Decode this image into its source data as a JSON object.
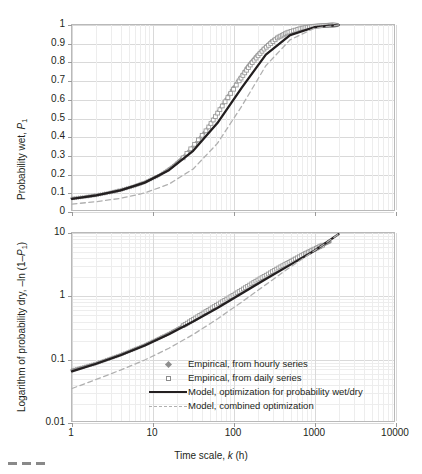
{
  "figure": {
    "background": "#ffffff",
    "series_color_empirical": "#8c8c8c",
    "model_color_solid": "#231f20",
    "model_color_dashed": "#b0b0b0",
    "grid_color": "#d9d9d9"
  },
  "top_panel": {
    "ylabel_pre": "Probability wet, ",
    "ylabel_var": "P",
    "ylabel_sub": "1",
    "yticks": [
      "0",
      "0.1",
      "0.2",
      "0.3",
      "0.4",
      "0.5",
      "0.6",
      "0.7",
      "0.8",
      "0.9",
      "1"
    ]
  },
  "bottom_panel": {
    "ylabel_pre": "Logarithm of probability dry, –ln (1–",
    "ylabel_var": "P",
    "ylabel_sub": "1",
    "ylabel_post": ")",
    "yticks": [
      "0.01",
      "0.1",
      "1",
      "10"
    ]
  },
  "xaxis": {
    "ticks": [
      "1",
      "10",
      "100",
      "1000",
      "10000"
    ],
    "title_pre": "Time scale, ",
    "title_var": "k",
    "title_post": " (h)"
  },
  "legend": {
    "items": [
      {
        "key": "marker-diamond",
        "label": "Empirical, from hourly series"
      },
      {
        "key": "marker-square",
        "label": "Empirical, from daily series"
      },
      {
        "key": "line-solid",
        "label": "Model, optimization for probability wet/dry"
      },
      {
        "key": "line-dashed",
        "label": "Model, combined optimization"
      }
    ]
  },
  "chart_data": {
    "type": "line",
    "panels": [
      {
        "id": "top",
        "title": "",
        "xlabel": "Time scale, k (h)",
        "ylabel": "Probability wet, P1",
        "xscale": "log",
        "yscale": "linear",
        "xlim": [
          1,
          10000
        ],
        "ylim": [
          0,
          1
        ],
        "grid": true,
        "yticks": [
          0,
          0.1,
          0.2,
          0.3,
          0.4,
          0.5,
          0.6,
          0.7,
          0.8,
          0.9,
          1
        ],
        "xticks": [
          1,
          10,
          100,
          1000,
          10000
        ],
        "series": [
          {
            "name": "Empirical, from hourly series",
            "style": "markers-diamond",
            "color": "#8c8c8c",
            "x": [
              1,
              1.5,
              2,
              3,
              4,
              6,
              8,
              12,
              18,
              24,
              36,
              48,
              72,
              100,
              150,
              200,
              300,
              450,
              600,
              800,
              1000,
              1300,
              1600,
              2000
            ],
            "y": [
              0.063,
              0.072,
              0.08,
              0.095,
              0.108,
              0.13,
              0.15,
              0.186,
              0.238,
              0.285,
              0.37,
              0.44,
              0.56,
              0.66,
              0.775,
              0.84,
              0.915,
              0.958,
              0.975,
              0.988,
              0.993,
              0.997,
              0.999,
              1.0
            ]
          },
          {
            "name": "Empirical, from daily series",
            "style": "markers-square",
            "color": "#9a9a9a",
            "x": [
              24,
              48,
              72,
              120,
              168,
              240,
              360,
              480,
              720,
              1000,
              1440,
              1800
            ],
            "y": [
              0.282,
              0.437,
              0.556,
              0.7,
              0.79,
              0.868,
              0.932,
              0.96,
              0.983,
              0.993,
              0.998,
              1.0
            ]
          },
          {
            "name": "Model, optimization for probability wet/dry",
            "style": "line-solid",
            "color": "#231f20",
            "x": [
              1,
              2,
              4,
              8,
              16,
              32,
              64,
              128,
              256,
              512,
              1024,
              2048
            ],
            "y": [
              0.06,
              0.079,
              0.106,
              0.148,
              0.215,
              0.32,
              0.47,
              0.66,
              0.84,
              0.945,
              0.988,
              1.0
            ]
          },
          {
            "name": "Model, combined optimization",
            "style": "line-dashed",
            "color": "#b0b0b0",
            "x": [
              1,
              2,
              4,
              8,
              16,
              32,
              64,
              128,
              256,
              512,
              1024,
              2048
            ],
            "y": [
              0.032,
              0.045,
              0.063,
              0.092,
              0.14,
              0.222,
              0.36,
              0.56,
              0.78,
              0.92,
              0.982,
              1.0
            ]
          }
        ]
      },
      {
        "id": "bottom",
        "title": "",
        "xlabel": "Time scale, k (h)",
        "ylabel": "Logarithm of probability dry, -ln (1-P1)",
        "xscale": "log",
        "yscale": "log",
        "xlim": [
          1,
          10000
        ],
        "ylim": [
          0.01,
          10
        ],
        "grid": true,
        "yticks": [
          0.01,
          0.1,
          1,
          10
        ],
        "xticks": [
          1,
          10,
          100,
          1000,
          10000
        ],
        "series": [
          {
            "name": "Empirical, from hourly series",
            "style": "markers-diamond",
            "color": "#8c8c8c",
            "x": [
              1,
              2,
              4,
              8,
              16,
              32,
              64,
              128,
              256,
              512,
              1024,
              1600
            ],
            "y": [
              0.065,
              0.083,
              0.114,
              0.163,
              0.25,
              0.405,
              0.69,
              1.2,
              2.1,
              3.6,
              5.6,
              7.2
            ]
          },
          {
            "name": "Empirical, from daily series",
            "style": "markers-square",
            "color": "#9a9a9a",
            "x": [
              24,
              48,
              96,
              192,
              384,
              768,
              1300
            ],
            "y": [
              0.332,
              0.575,
              0.98,
              1.7,
              2.85,
              4.6,
              6.4
            ]
          },
          {
            "name": "Model, optimization for probability wet/dry",
            "style": "line-solid",
            "color": "#231f20",
            "x": [
              1,
              2,
              4,
              8,
              16,
              32,
              64,
              128,
              256,
              512,
              1024,
              2048
            ],
            "y": [
              0.062,
              0.082,
              0.112,
              0.16,
              0.242,
              0.386,
              0.635,
              1.08,
              1.85,
              3.1,
              5.2,
              9.6
            ]
          },
          {
            "name": "Model, combined optimization",
            "style": "line-dashed",
            "color": "#b0b0b0",
            "x": [
              1,
              2,
              4,
              8,
              16,
              32,
              64,
              128,
              256,
              512,
              1024,
              2048
            ],
            "y": [
              0.033,
              0.046,
              0.065,
              0.094,
              0.145,
              0.24,
              0.425,
              0.79,
              1.5,
              2.85,
              5.2,
              9.6
            ]
          }
        ]
      }
    ]
  }
}
